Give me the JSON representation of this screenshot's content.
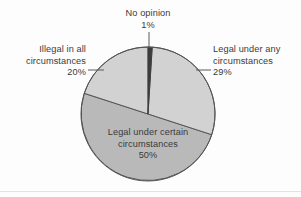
{
  "chart_data": {
    "type": "pie",
    "title": "",
    "subtitle": "",
    "xlabel": "",
    "ylabel": "",
    "legend_position": "callout-labels",
    "grid": false,
    "unit": "%",
    "geometry": {
      "center_x": 148,
      "center_y": 114,
      "radius": 67,
      "start_angle_deg": 0,
      "direction": "clockwise"
    },
    "categories": [
      "No opinion",
      "Legal under any circumstances",
      "Legal under certain circumstances",
      "Illegal in all circumstances"
    ],
    "values": [
      1,
      29,
      50,
      20
    ],
    "slices": [
      {
        "label": "No opinion",
        "value": 1,
        "value_text": "1%",
        "color": "#3c3c3c",
        "start_deg": 0,
        "end_deg": 3.6
      },
      {
        "label": "Legal under any circumstances",
        "value": 29,
        "value_text": "29%",
        "color": "#d2d2d2",
        "start_deg": 3.6,
        "end_deg": 108
      },
      {
        "label": "Legal under certain circumstances",
        "value": 50,
        "value_text": "50%",
        "color": "#b9b9b9",
        "start_deg": 108,
        "end_deg": 288
      },
      {
        "label": "Illegal in all circumstances",
        "value": 20,
        "value_text": "20%",
        "color": "#d2d2d2",
        "start_deg": 288,
        "end_deg": 360
      }
    ]
  },
  "labels": {
    "no_opinion": {
      "line1": "No opinion",
      "percent": "1%"
    },
    "illegal_all": {
      "line1": "Illegal in all",
      "line2": "circumstances",
      "percent": "20%"
    },
    "legal_any": {
      "line1": "Legal under any",
      "line2": "circumstances",
      "percent": "29%"
    },
    "legal_certain": {
      "line1": "Legal under certain",
      "line2": "circumstances",
      "percent": "50%"
    }
  },
  "style": {
    "background": "#fdfdfd",
    "text_color": "#3a3a3a",
    "outline_color": "#555555",
    "leader_color": "#5a5a5a"
  }
}
